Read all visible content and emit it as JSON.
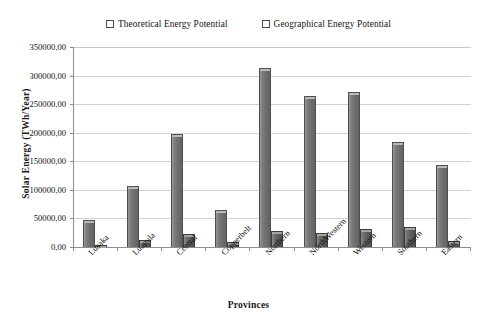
{
  "chart_data": {
    "type": "bar",
    "title": "",
    "xlabel": "Provinces",
    "ylabel": "Solar Energy (TWh/Year)",
    "categories": [
      "Lusaka",
      "Luapula",
      "Central",
      "Copperbelt",
      "Northern",
      "NorthWestern",
      "Western",
      "Southern",
      "Eastern"
    ],
    "series": [
      {
        "name": "Theoretical Energy Potential",
        "color": "#747474",
        "values": [
          47000,
          106000,
          198000,
          65000,
          313000,
          264000,
          272000,
          183000,
          144000
        ]
      },
      {
        "name": "Geographical Energy Potential",
        "color": "#5a5a5a",
        "values": [
          3000,
          13000,
          22000,
          8000,
          28000,
          24000,
          31000,
          35000,
          10000
        ]
      }
    ],
    "ylim": [
      0,
      350000
    ],
    "ytick_values": [
      0,
      50000,
      100000,
      150000,
      200000,
      250000,
      300000,
      350000
    ],
    "ytick_labels": [
      "0,00",
      "50000,00",
      "100000,00",
      "150000,00",
      "200000,00",
      "250000,00",
      "300000,00",
      "350000,00"
    ],
    "grid": true,
    "grid_axis": "y",
    "legend_position": "top",
    "legend_marker": "square",
    "decimal_separator": ","
  },
  "caption": {
    "text": ""
  }
}
